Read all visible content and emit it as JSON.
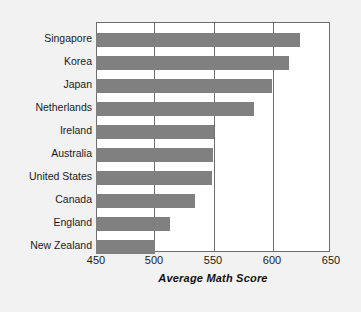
{
  "chart_data": {
    "type": "bar",
    "orientation": "horizontal",
    "title": "",
    "xlabel": "Average Math Score",
    "ylabel": "",
    "xlim": [
      450,
      650
    ],
    "xticks": [
      450,
      500,
      550,
      600,
      650
    ],
    "xtick_labels": [
      "450",
      "500",
      "550",
      "600",
      "650"
    ],
    "grid": "vertical",
    "legend": "none",
    "bar_color": "#808080",
    "frame_color": "#6e6e6e",
    "categories": [
      "Singapore",
      "Korea",
      "Japan",
      "Netherlands",
      "Ireland",
      "Australia",
      "United States",
      "Canada",
      "England",
      "New Zealand"
    ],
    "values": [
      624,
      615,
      600,
      585,
      551,
      550,
      549,
      535,
      513,
      500
    ]
  }
}
